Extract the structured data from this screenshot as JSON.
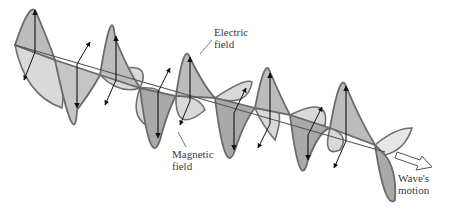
{
  "diagram": {
    "labels": {
      "electric_field": "Electric\nfield",
      "magnetic_field": "Magnetic\nfield",
      "wave_motion": "Wave's\nmotion"
    },
    "colors": {
      "outline": "#6e6e6e",
      "electric_fill": "#bdbdbd",
      "electric_fill_dark": "#a8a8a8",
      "magnetic_fill": "#dcdcdc",
      "axis": "#555555",
      "arrow": "#111111"
    }
  }
}
